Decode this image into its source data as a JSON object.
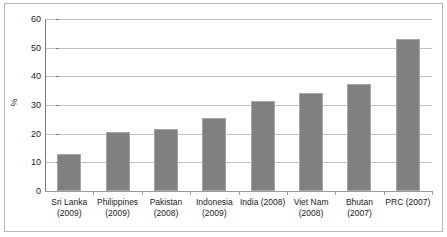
{
  "chart_data": {
    "type": "bar",
    "title": "",
    "subtitle": "",
    "xlabel": "",
    "ylabel": "%",
    "ylim": [
      0,
      60
    ],
    "ytick_values": [
      0,
      10,
      20,
      30,
      40,
      50,
      60
    ],
    "ytick_labels": [
      "0",
      "10",
      "20",
      "30",
      "40",
      "50",
      "60"
    ],
    "grid": true,
    "legend": false,
    "legend_position": "none",
    "bar_color": "#808080",
    "bar_border_color": "#a6a6a6",
    "gridline_color": "#c0c0c0",
    "axis_color": "#7a7a7a",
    "frame_color": "#b8b8b8",
    "categories": [
      "Sri Lanka\n(2009)",
      "Philippines\n(2009)",
      "Pakistan\n(2008)",
      "Indonesia\n(2009)",
      "India (2008)",
      "Viet Nam\n(2008)",
      "Bhutan\n(2007)",
      "PRC (2007)"
    ],
    "values": [
      12.9,
      20.7,
      21.6,
      25.5,
      31.5,
      34.3,
      37.3,
      53.2
    ]
  }
}
